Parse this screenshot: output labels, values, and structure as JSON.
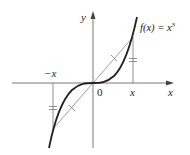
{
  "figure": {
    "function_label": "f(x) = x",
    "function_exponent": "3",
    "axis_labels": {
      "y": "y",
      "x": "x"
    },
    "tick_labels": {
      "negative_x": "−x",
      "origin": "0",
      "positive_x": "x"
    },
    "colors": {
      "curve": "#222222",
      "axis": "#555555",
      "chord": "#777777",
      "background": "#ffffff"
    }
  }
}
